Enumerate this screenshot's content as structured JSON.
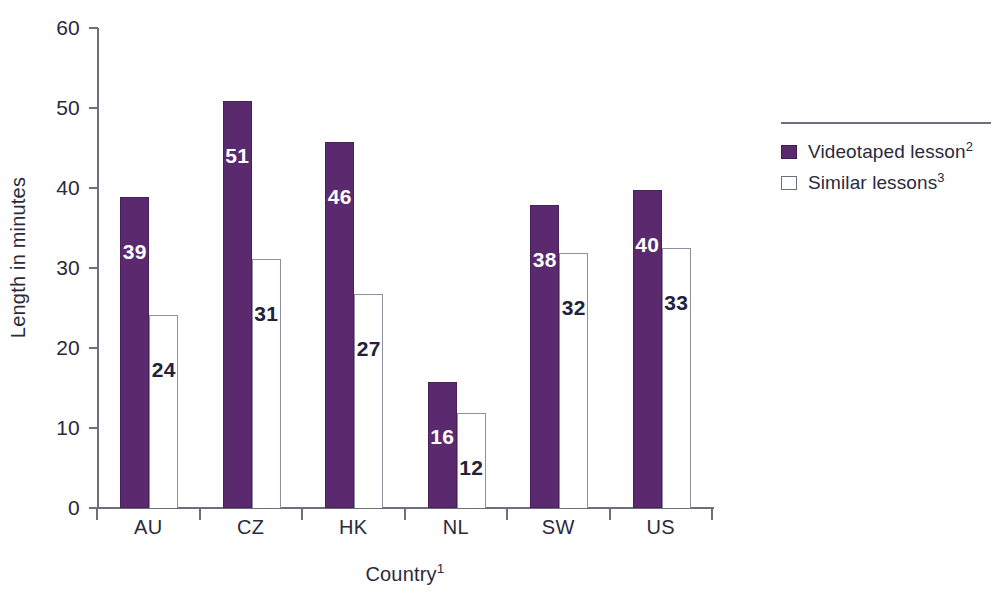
{
  "chart_data": {
    "type": "bar",
    "title": "",
    "subtitle": "",
    "xlabel": "Country",
    "xlabel_superscript": "1",
    "ylabel": "Length in minutes",
    "ylim": [
      0,
      60
    ],
    "ytick_values": [
      0,
      10,
      20,
      30,
      40,
      50,
      60
    ],
    "ytick_labels": [
      "0",
      "10",
      "20",
      "30",
      "40",
      "50",
      "60"
    ],
    "grid": false,
    "legend_position": "right",
    "categories": [
      "AU",
      "CZ",
      "HK",
      "NL",
      "SW",
      "US"
    ],
    "series": [
      {
        "name": "Videotaped lesson",
        "name_superscript": "2",
        "color": "#5B2A6E",
        "values": [
          39,
          51,
          46,
          16,
          38,
          40
        ],
        "plotted": [
          38.9,
          50.9,
          45.8,
          15.8,
          37.9,
          39.7
        ],
        "label_color": "#FFFFFF"
      },
      {
        "name": "Similar lessons",
        "name_superscript": "3",
        "color": "#FFFFFF",
        "border_color": "#8E8FA0",
        "values": [
          24,
          31,
          27,
          12,
          32,
          33
        ],
        "plotted": [
          24.1,
          31.1,
          26.7,
          11.9,
          31.9,
          32.5
        ],
        "label_color": "#22223A"
      }
    ]
  },
  "legend": {
    "items": [
      {
        "label": "Videotaped lesson",
        "sup": "2",
        "swatch": "purple-filled-swatch"
      },
      {
        "label": "Similar lessons",
        "sup": "3",
        "swatch": "white-outlined-swatch"
      }
    ]
  },
  "colors": {
    "series_purple": "#5B2A6E",
    "series_white": "#FFFFFF",
    "axis": "#6C6F80",
    "text": "#2A2A3C",
    "background": "#FFFFFF"
  }
}
